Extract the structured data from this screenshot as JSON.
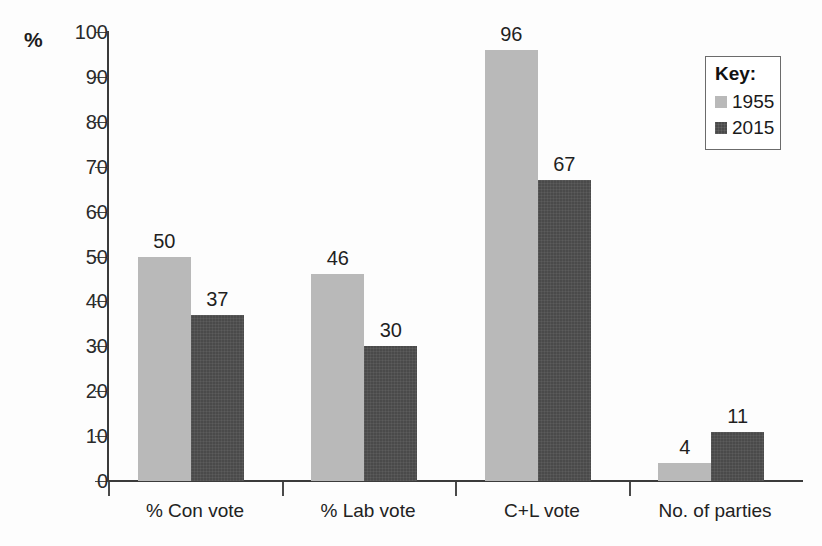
{
  "axis_unit_label": "%",
  "legend": {
    "title": "Key:",
    "entries": [
      {
        "label": "1955",
        "color": "#b9b9b9",
        "swatch_name": "legend-swatch-1955"
      },
      {
        "label": "2015",
        "color": "#4a4a4a",
        "swatch_name": "legend-swatch-2015"
      }
    ]
  },
  "chart_data": {
    "type": "bar",
    "title": "",
    "xlabel": "",
    "ylabel": "%",
    "ylim": [
      0,
      100
    ],
    "ytick_values": [
      0,
      10,
      20,
      30,
      40,
      50,
      60,
      70,
      80,
      90,
      100
    ],
    "ytick_labels": [
      "0",
      "10",
      "20",
      "30",
      "40",
      "50",
      "60",
      "70",
      "80",
      "90",
      "100"
    ],
    "grid": false,
    "legend_position": "top-right",
    "categories": [
      "% Con vote",
      "% Lab vote",
      "C+L vote",
      "No. of parties"
    ],
    "series": [
      {
        "name": "1955",
        "color": "#b9b9b9",
        "values": [
          50,
          46,
          96,
          4
        ]
      },
      {
        "name": "2015",
        "color": "#4a4a4a",
        "values": [
          37,
          30,
          67,
          11
        ]
      }
    ],
    "data_labels": [
      [
        "50",
        "46",
        "96",
        "4"
      ],
      [
        "37",
        "30",
        "67",
        "11"
      ]
    ]
  }
}
